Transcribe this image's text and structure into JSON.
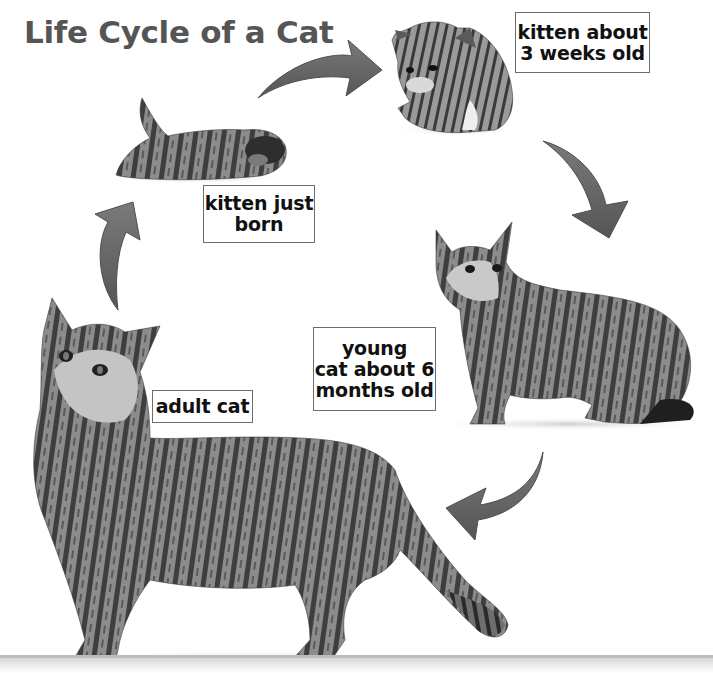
{
  "title": "Life Cycle of a Cat",
  "colors": {
    "title_text": "#555555",
    "arrow_fill": "#5e5e5e",
    "arrow_highlight": "#8a8a8a",
    "label_border": "#6d6d6d",
    "label_text": "#111111",
    "floor_line": "#bdbdbd"
  },
  "stages": [
    {
      "id": "newborn",
      "label": "kitten just\nborn",
      "image": "newborn-kitten-lying-down"
    },
    {
      "id": "three-weeks",
      "label": "kitten about\n3 weeks old",
      "image": "kitten-crouching"
    },
    {
      "id": "six-months",
      "label": "young\ncat about 6\nmonths old",
      "image": "young-tabby-cat-standing"
    },
    {
      "id": "adult",
      "label": "adult cat",
      "image": "adult-tabby-cat-standing"
    }
  ],
  "arrows": [
    {
      "from": "newborn",
      "to": "three-weeks",
      "direction": "right"
    },
    {
      "from": "three-weeks",
      "to": "six-months",
      "direction": "down-right"
    },
    {
      "from": "six-months",
      "to": "adult",
      "direction": "down-left"
    },
    {
      "from": "adult",
      "to": "newborn",
      "direction": "up"
    }
  ]
}
